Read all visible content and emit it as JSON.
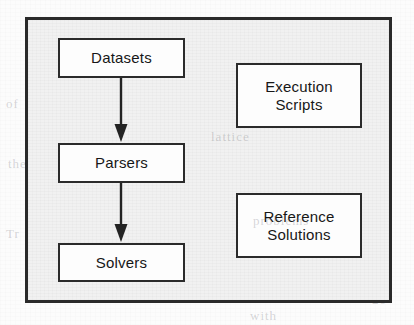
{
  "diagram": {
    "frame": {
      "border_color": "#2a2a2a",
      "background_color": "#f1f1f1"
    },
    "pipeline": {
      "name": "processing-pipeline",
      "nodes": [
        {
          "id": "datasets",
          "label": "Datasets"
        },
        {
          "id": "parsers",
          "label": "Parsers"
        },
        {
          "id": "solvers",
          "label": "Solvers"
        }
      ],
      "edges": [
        {
          "from": "datasets",
          "to": "parsers",
          "style": "solid-arrow-down"
        },
        {
          "from": "parsers",
          "to": "solvers",
          "style": "solid-arrow-down"
        }
      ]
    },
    "standalone": {
      "name": "supporting-components",
      "nodes": [
        {
          "id": "execution-scripts",
          "line1": "Execution",
          "line2": "Scripts"
        },
        {
          "id": "reference-solutions",
          "line1": "Reference",
          "line2": "Solutions"
        }
      ]
    },
    "node_style": {
      "border_color": "#2b2b2b",
      "fill_color": "#fdfdfd",
      "text_color": "#171717"
    },
    "scan_artifacts": {
      "ghost_text": [
        {
          "text": "in the",
          "x": 300,
          "y": 22
        },
        {
          "text": "of",
          "x": 6,
          "y": 96
        },
        {
          "text": "lattice",
          "x": 208,
          "y": 126
        },
        {
          "text": "the",
          "x": 8,
          "y": 156
        },
        {
          "text": "problems",
          "x": 250,
          "y": 210
        },
        {
          "text": "Tr",
          "x": 6,
          "y": 226
        },
        {
          "text": "20",
          "x": 372,
          "y": 292
        },
        {
          "text": "with",
          "x": 250,
          "y": 308
        }
      ]
    }
  }
}
